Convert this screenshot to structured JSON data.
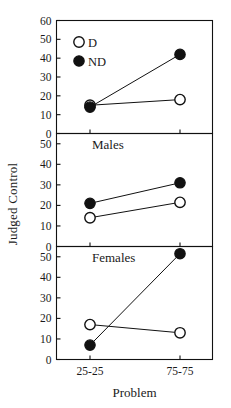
{
  "figure": {
    "xlabel": "Problem",
    "ylabel": "Judged Control",
    "xticklabels": [
      "25-25",
      "75-75"
    ],
    "legend": [
      {
        "key": "D",
        "label": "D",
        "marker": "open-circle"
      },
      {
        "key": "ND",
        "label": "ND",
        "marker": "filled-circle"
      }
    ],
    "panels": [
      {
        "title": "",
        "yticklabels": [
          "0",
          "10",
          "20",
          "30",
          "40",
          "50",
          "60"
        ]
      },
      {
        "title": "Males",
        "yticklabels": [
          "0",
          "10",
          "20",
          "30",
          "40",
          "50"
        ]
      },
      {
        "title": "Females",
        "yticklabels": [
          "0",
          "10",
          "20",
          "30",
          "40",
          "50"
        ]
      }
    ]
  },
  "chart_data": [
    {
      "type": "line",
      "title": "",
      "panel": "Combined",
      "xlabel": "Problem",
      "ylabel": "Judged Control",
      "categories": [
        "25-25",
        "75-75"
      ],
      "ylim": [
        0,
        60
      ],
      "yticks": [
        0,
        10,
        20,
        30,
        40,
        50,
        60
      ],
      "grid": false,
      "legend_position": "upper-left-inside",
      "series": [
        {
          "name": "D",
          "marker": "open-circle",
          "values": [
            15,
            18
          ]
        },
        {
          "name": "ND",
          "marker": "filled-circle",
          "values": [
            14,
            42
          ]
        }
      ]
    },
    {
      "type": "line",
      "title": "Males",
      "panel": "Males",
      "xlabel": "Problem",
      "ylabel": "Judged Control",
      "categories": [
        "25-25",
        "75-75"
      ],
      "ylim": [
        0,
        55
      ],
      "yticks": [
        0,
        10,
        20,
        30,
        40,
        50
      ],
      "grid": false,
      "series": [
        {
          "name": "D",
          "marker": "open-circle",
          "values": [
            14,
            21.5
          ]
        },
        {
          "name": "ND",
          "marker": "filled-circle",
          "values": [
            21,
            31
          ]
        }
      ]
    },
    {
      "type": "line",
      "title": "Females",
      "panel": "Females",
      "xlabel": "Problem",
      "ylabel": "Judged Control",
      "categories": [
        "25-25",
        "75-75"
      ],
      "ylim": [
        0,
        55
      ],
      "yticks": [
        0,
        10,
        20,
        30,
        40,
        50
      ],
      "grid": false,
      "series": [
        {
          "name": "D",
          "marker": "open-circle",
          "values": [
            17,
            13
          ]
        },
        {
          "name": "ND",
          "marker": "filled-circle",
          "values": [
            7,
            51.5
          ]
        }
      ]
    }
  ]
}
